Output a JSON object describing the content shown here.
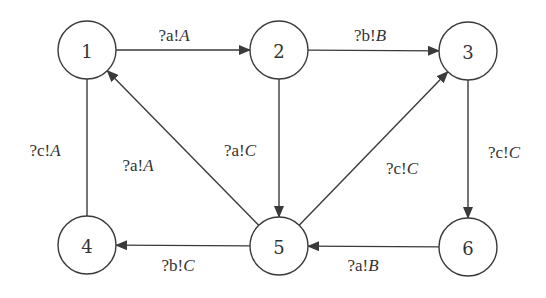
{
  "diagram": {
    "type": "state-transition-graph",
    "colors": {
      "stroke": "#3a3a3a",
      "text": "#333333",
      "background": "#ffffff",
      "node_fill": "#ffffff"
    },
    "node_radius": 29,
    "nodes": [
      {
        "id": "1",
        "label": "1",
        "x": 87,
        "y": 50
      },
      {
        "id": "2",
        "label": "2",
        "x": 279,
        "y": 50
      },
      {
        "id": "3",
        "label": "3",
        "x": 468,
        "y": 51
      },
      {
        "id": "4",
        "label": "4",
        "x": 87,
        "y": 245
      },
      {
        "id": "5",
        "label": "5",
        "x": 279,
        "y": 246
      },
      {
        "id": "6",
        "label": "6",
        "x": 468,
        "y": 247
      }
    ],
    "edges": [
      {
        "from": "1",
        "to": "2",
        "label_input": "?a!",
        "label_output": "A",
        "arrow": true,
        "label_x": 174,
        "label_y": 35
      },
      {
        "from": "2",
        "to": "3",
        "label_input": "?b!",
        "label_output": "B",
        "arrow": true,
        "label_x": 370,
        "label_y": 35
      },
      {
        "from": "4",
        "to": "1",
        "label_input": "?c!",
        "label_output": "A",
        "arrow": false,
        "label_x": 45,
        "label_y": 150
      },
      {
        "from": "5",
        "to": "1",
        "label_input": "?a!",
        "label_output": "A",
        "arrow": true,
        "label_x": 138,
        "label_y": 165
      },
      {
        "from": "2",
        "to": "5",
        "label_input": "?a!",
        "label_output": "C",
        "arrow": true,
        "label_x": 240,
        "label_y": 150
      },
      {
        "from": "5",
        "to": "3",
        "label_input": "?c!",
        "label_output": "C",
        "arrow": true,
        "label_x": 402,
        "label_y": 168
      },
      {
        "from": "3",
        "to": "6",
        "label_input": "?c!",
        "label_output": "C",
        "arrow": true,
        "label_x": 504,
        "label_y": 152
      },
      {
        "from": "5",
        "to": "4",
        "label_input": "?b!",
        "label_output": "C",
        "arrow": true,
        "label_x": 178,
        "label_y": 265
      },
      {
        "from": "6",
        "to": "5",
        "label_input": "?a!",
        "label_output": "B",
        "arrow": true,
        "label_x": 363,
        "label_y": 265
      }
    ]
  }
}
